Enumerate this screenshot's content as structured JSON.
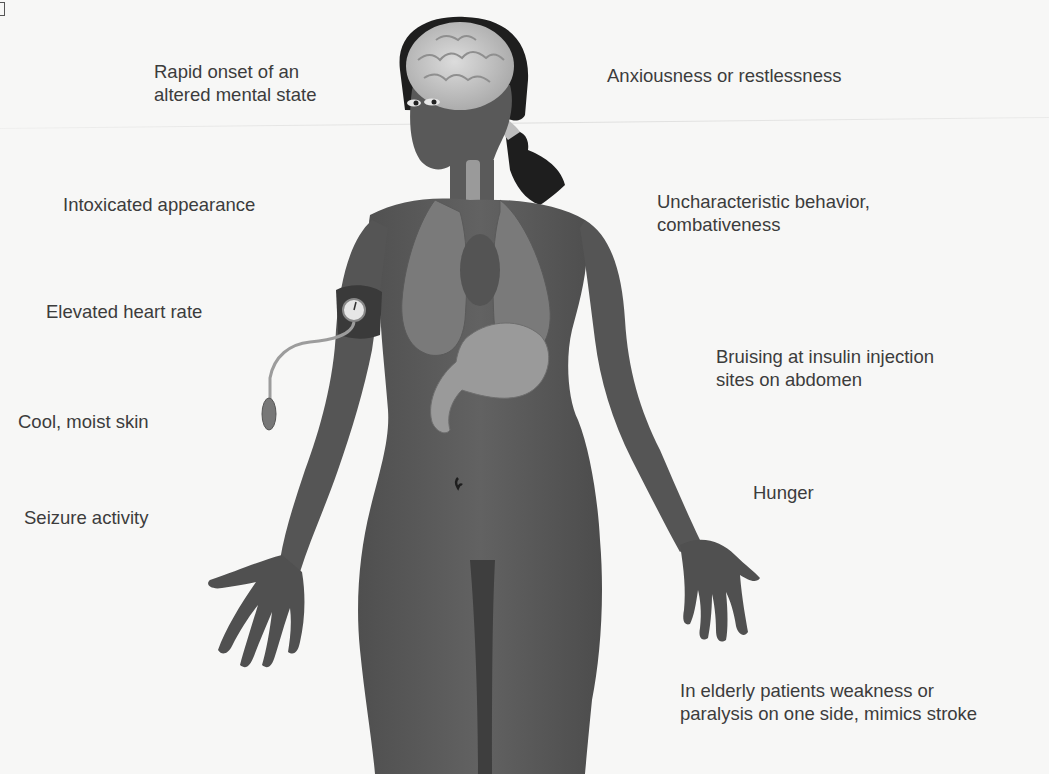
{
  "diagram": {
    "colors": {
      "background": "#f7f7f6",
      "skin": "#5e5e5e",
      "skin_dark": "#4a4a4a",
      "organs": "#7a7a7a",
      "brain": "#cfcfcf",
      "hair": "#1e1e1e",
      "text": "#3c3c3c"
    },
    "labels_left": [
      {
        "id": "rapid-onset",
        "lines": [
          "Rapid onset of an",
          "altered mental state"
        ]
      },
      {
        "id": "intoxicated",
        "lines": [
          "Intoxicated appearance"
        ]
      },
      {
        "id": "heart-rate",
        "lines": [
          "Elevated heart rate"
        ]
      },
      {
        "id": "skin",
        "lines": [
          "Cool, moist skin"
        ]
      },
      {
        "id": "seizure",
        "lines": [
          "Seizure activity"
        ]
      }
    ],
    "labels_right": [
      {
        "id": "anxiousness",
        "lines": [
          "Anxiousness or restlessness"
        ]
      },
      {
        "id": "behavior",
        "lines": [
          "Uncharacteristic behavior,",
          "combativeness"
        ]
      },
      {
        "id": "bruising",
        "lines": [
          "Bruising at insulin injection",
          "sites on abdomen"
        ]
      },
      {
        "id": "hunger",
        "lines": [
          "Hunger"
        ]
      },
      {
        "id": "elderly",
        "lines": [
          "In elderly patients weakness or",
          "paralysis on one side, mimics stroke"
        ]
      }
    ]
  }
}
